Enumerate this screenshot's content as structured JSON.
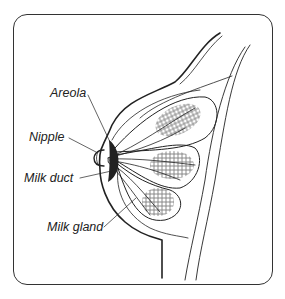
{
  "diagram": {
    "labels": [
      {
        "id": "areola",
        "text": "Areola"
      },
      {
        "id": "nipple",
        "text": "Nipple"
      },
      {
        "id": "milk_duct",
        "text": "Milk duct"
      },
      {
        "id": "milk_gland",
        "text": "Milk gland"
      }
    ],
    "colors": {
      "line": "#222222",
      "background": "#ffffff"
    }
  }
}
